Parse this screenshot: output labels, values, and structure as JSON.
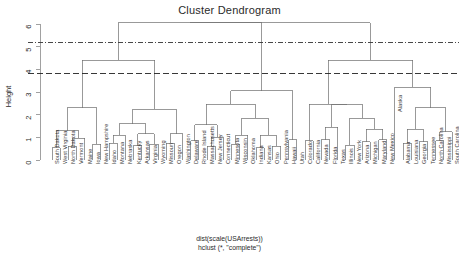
{
  "title": "Cluster Dendrogram",
  "ylabel": "Height",
  "footer": {
    "line1": "dist(scale(USArrests))",
    "line2": "hclust (*, \"complete\")"
  },
  "axis": {
    "ticks": [
      "0",
      "1",
      "2",
      "3",
      "4",
      "5",
      "6"
    ],
    "tick_values": [
      0,
      1,
      2,
      3,
      4,
      5,
      6
    ],
    "ylim": [
      0,
      6.3
    ]
  },
  "cut_lines": [
    {
      "name": "cut-line-upper",
      "height": 5.2,
      "style": "dash-dot",
      "color": "#333333"
    },
    {
      "name": "cut-line-lower",
      "height": 3.8,
      "style": "dashed",
      "color": "#222222"
    }
  ],
  "chart_data": {
    "type": "dendrogram",
    "title": "Cluster Dendrogram",
    "xlabel": "dist(scale(USArrests))",
    "ylabel": "Height",
    "ylim": [
      0,
      6.3
    ],
    "grid": false,
    "linkage": "complete",
    "distance": "euclidean on scaled USArrests",
    "leaves": [
      "South Dakota",
      "West Virginia",
      "North Dakota",
      "Vermont",
      "Maine",
      "Iowa",
      "New Hampshire",
      "Idaho",
      "Montana",
      "Nebraska",
      "Kentucky",
      "Arkansas",
      "Virginia",
      "Wyoming",
      "Missouri",
      "Oregon",
      "Washington",
      "Delaware",
      "Rhode Island",
      "Massachusetts",
      "New Jersey",
      "Connecticut",
      "Minnesota",
      "Wisconsin",
      "Oklahoma",
      "Indiana",
      "Kansas",
      "Ohio",
      "Pennsylvania",
      "Hawaii",
      "Utah",
      "Colorado",
      "California",
      "Nevada",
      "Florida",
      "Texas",
      "Illinois",
      "New York",
      "Arizona",
      "Michigan",
      "Maryland",
      "New Mexico",
      "Alaska",
      "Alabama",
      "Louisiana",
      "Georgia",
      "Tennessee",
      "North Carolina",
      "Mississippi",
      "South Carolina"
    ],
    "merges": [
      {
        "id": "m1",
        "left": "South Dakota",
        "right": "West Virginia",
        "height": 0.55
      },
      {
        "id": "m2",
        "left": "North Dakota",
        "right": "Vermont",
        "height": 0.6
      },
      {
        "id": "m3",
        "left": "m2",
        "right": "Maine",
        "height": 0.95
      },
      {
        "id": "m4",
        "left": "m1",
        "right": "m3",
        "height": 1.3
      },
      {
        "id": "m5",
        "left": "Iowa",
        "right": "New Hampshire",
        "height": 0.7
      },
      {
        "id": "m6",
        "left": "m4",
        "right": "m5",
        "height": 2.3
      },
      {
        "id": "m7",
        "left": "Idaho",
        "right": "Montana",
        "height": 0.75
      },
      {
        "id": "m8",
        "left": "m7",
        "right": "Nebraska",
        "height": 1.1
      },
      {
        "id": "m9",
        "left": "Kentucky",
        "right": "Arkansas",
        "height": 0.65
      },
      {
        "id": "m10",
        "left": "Virginia",
        "right": "Wyoming",
        "height": 0.7
      },
      {
        "id": "m11",
        "left": "m9",
        "right": "m10",
        "height": 1.15
      },
      {
        "id": "m12",
        "left": "m8",
        "right": "m11",
        "height": 1.6
      },
      {
        "id": "m13",
        "left": "Missouri",
        "right": "Oregon",
        "height": 0.75
      },
      {
        "id": "m14",
        "left": "m13",
        "right": "Washington",
        "height": 1.15
      },
      {
        "id": "m15",
        "left": "m12",
        "right": "m14",
        "height": 2.25
      },
      {
        "id": "m16",
        "left": "m6",
        "right": "m15",
        "height": 4.4
      },
      {
        "id": "m17",
        "left": "Delaware",
        "right": "Rhode Island",
        "height": 0.85
      },
      {
        "id": "m18",
        "left": "Massachusetts",
        "right": "New Jersey",
        "height": 0.6
      },
      {
        "id": "m19",
        "left": "m18",
        "right": "Connecticut",
        "height": 1.0
      },
      {
        "id": "m20",
        "left": "m17",
        "right": "m19",
        "height": 1.55
      },
      {
        "id": "m21",
        "left": "Minnesota",
        "right": "Wisconsin",
        "height": 0.7
      },
      {
        "id": "m22",
        "left": "m21",
        "right": "Oklahoma",
        "height": 1.1
      },
      {
        "id": "m23",
        "left": "Indiana",
        "right": "Kansas",
        "height": 0.55
      },
      {
        "id": "m24",
        "left": "Ohio",
        "right": "Pennsylvania",
        "height": 0.6
      },
      {
        "id": "m25",
        "left": "m23",
        "right": "m24",
        "height": 1.1
      },
      {
        "id": "m26",
        "left": "m22",
        "right": "m25",
        "height": 1.85
      },
      {
        "id": "m27",
        "left": "m20",
        "right": "m26",
        "height": 2.45
      },
      {
        "id": "m28",
        "left": "Hawaii",
        "right": "Utah",
        "height": 0.9
      },
      {
        "id": "m29",
        "left": "m28",
        "right": "m27",
        "height": 3.05
      },
      {
        "id": "m30",
        "left": "m16",
        "right": "m29",
        "height": 6.05
      },
      {
        "id": "m31",
        "left": "Colorado",
        "right": "California",
        "height": 0.85
      },
      {
        "id": "m32",
        "left": "Nevada",
        "right": "Florida",
        "height": 0.9
      },
      {
        "id": "m33",
        "left": "m32",
        "right": "Texas",
        "height": 1.45
      },
      {
        "id": "m34",
        "left": "Illinois",
        "right": "New York",
        "height": 0.65
      },
      {
        "id": "m35",
        "left": "Arizona",
        "right": "Michigan",
        "height": 0.8
      },
      {
        "id": "m36",
        "left": "Maryland",
        "right": "New Mexico",
        "height": 0.9
      },
      {
        "id": "m37",
        "left": "m35",
        "right": "m36",
        "height": 1.35
      },
      {
        "id": "m38",
        "left": "m34",
        "right": "m37",
        "height": 1.85
      },
      {
        "id": "m39",
        "left": "m33",
        "right": "m38",
        "height": 2.45
      },
      {
        "id": "m40",
        "left": "m31",
        "right": "m39",
        "height": 2.45
      },
      {
        "id": "m41",
        "left": "Alabama",
        "right": "Louisiana",
        "height": 0.75
      },
      {
        "id": "m42",
        "left": "Georgia",
        "right": "Tennessee",
        "height": 0.8
      },
      {
        "id": "m43",
        "left": "m41",
        "right": "m42",
        "height": 1.35
      },
      {
        "id": "m44",
        "left": "North Carolina",
        "right": "Mississippi",
        "height": 0.85
      },
      {
        "id": "m45",
        "left": "m44",
        "right": "South Carolina",
        "height": 1.25
      },
      {
        "id": "m46",
        "left": "m43",
        "right": "m45",
        "height": 2.3
      },
      {
        "id": "m47",
        "left": "Alaska",
        "right": "m46",
        "height": 3.2
      },
      {
        "id": "m48",
        "left": "m40",
        "right": "m47",
        "height": 4.4
      },
      {
        "id": "m49",
        "left": "m30",
        "right": "m48",
        "height": 6.05
      }
    ],
    "root": "m49"
  },
  "style": {
    "line_color": "#6e6e6e",
    "axis_color": "#8a8a8a",
    "text_color": "#2b2b2b"
  }
}
